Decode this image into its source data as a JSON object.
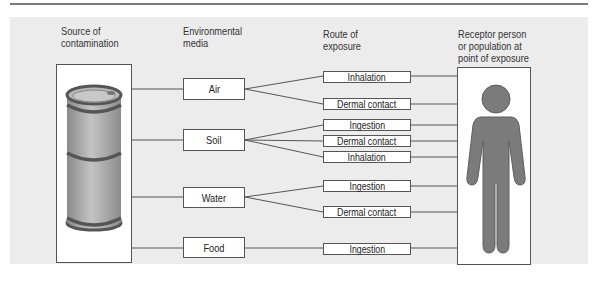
{
  "headers": {
    "source": [
      "Source of",
      "contamination"
    ],
    "media": [
      "Environmental",
      "media"
    ],
    "route": [
      "Route of",
      "exposure"
    ],
    "receptor": [
      "Receptor person",
      "or population at",
      "point of exposure"
    ]
  },
  "media": [
    {
      "label": "Air"
    },
    {
      "label": "Soil"
    },
    {
      "label": "Water"
    },
    {
      "label": "Food"
    }
  ],
  "routes": [
    {
      "label": "Inhalation",
      "medium": "Air"
    },
    {
      "label": "Dermal contact",
      "medium": "Air"
    },
    {
      "label": "Ingestion",
      "medium": "Soil"
    },
    {
      "label": "Dermal contact",
      "medium": "Soil"
    },
    {
      "label": "Inhalation",
      "medium": "Soil"
    },
    {
      "label": "Ingestion",
      "medium": "Water"
    },
    {
      "label": "Dermal contact",
      "medium": "Water"
    },
    {
      "label": "Ingestion",
      "medium": "Food"
    }
  ],
  "icons": {
    "source": "oil-drum-icon",
    "receptor": "person-silhouette-icon"
  },
  "colors": {
    "panel": "#ececec",
    "line": "#555555",
    "figure": "#7b7b7b",
    "drum": "#a8a8a8"
  }
}
